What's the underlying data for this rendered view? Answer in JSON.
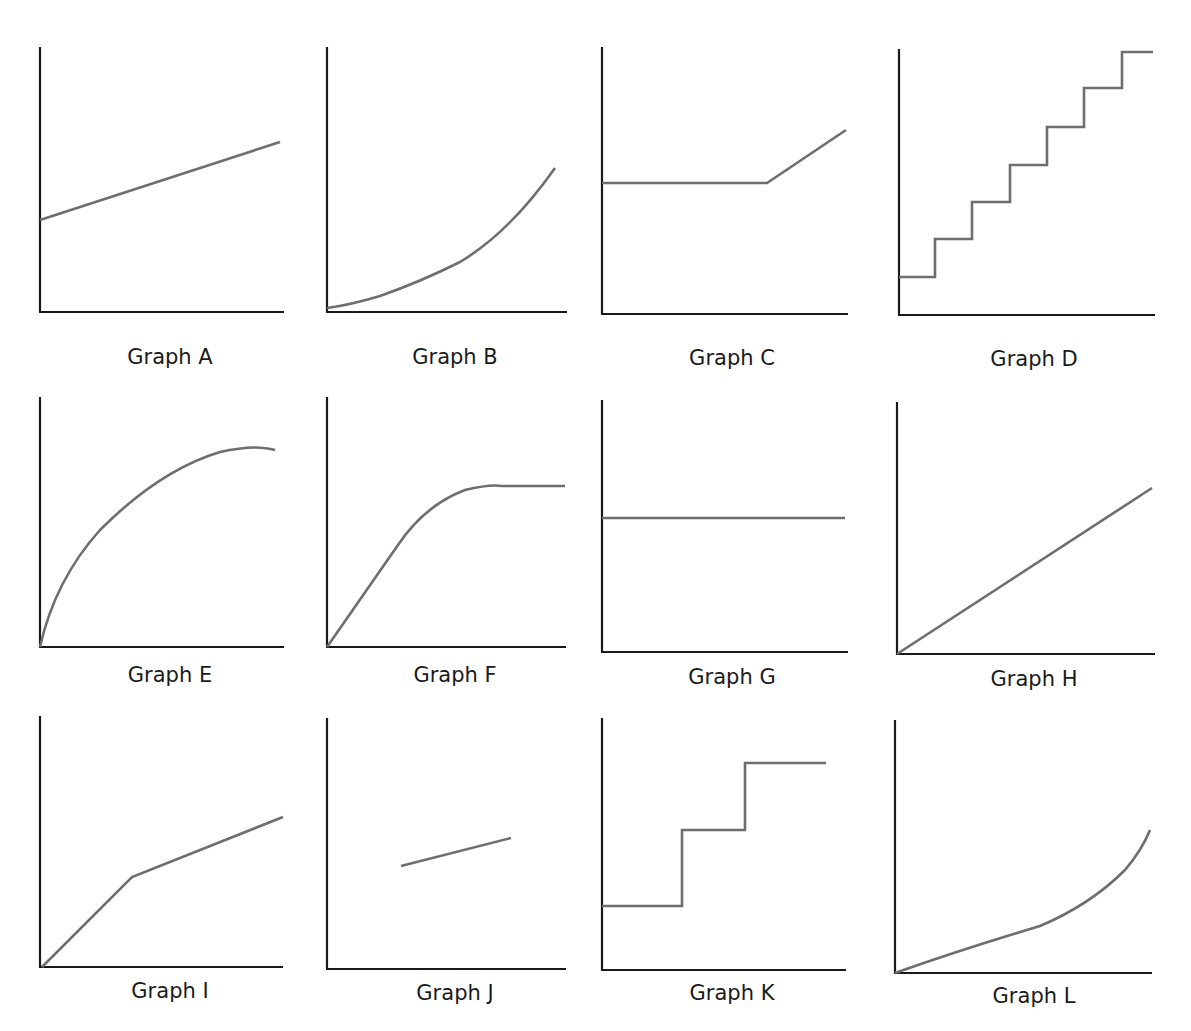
{
  "colors": {
    "axis": "#1a1a1a",
    "curve": "#6e6e6e",
    "background": "#ffffff"
  },
  "graphs": [
    {
      "id": "A",
      "label": "Graph A",
      "x0": 40,
      "y0": 312,
      "xEnd": 284,
      "yTop": 47,
      "capX": 170,
      "capY": 345,
      "path": "M40,220 L280,142",
      "shape": "linear increasing, positive y-intercept"
    },
    {
      "id": "B",
      "label": "Graph B",
      "x0": 327,
      "y0": 312,
      "xEnd": 567,
      "yTop": 47,
      "capX": 455,
      "capY": 345,
      "path": "M327,308 Q350,305 380,296 Q420,282 460,262 Q510,232 555,168",
      "shape": "curve increasing, accelerating"
    },
    {
      "id": "C",
      "label": "Graph C",
      "x0": 602,
      "y0": 314,
      "xEnd": 848,
      "yTop": 47,
      "capX": 732,
      "capY": 346,
      "path": "M602,183 L767,183 L846,130",
      "shape": "constant then linear increase"
    },
    {
      "id": "D",
      "label": "Graph D",
      "x0": 899,
      "y0": 315,
      "xEnd": 1155,
      "yTop": 49,
      "capX": 1034,
      "capY": 347,
      "path": "M899,277 L935,277 L935,239 L972,239 L972,202 L1010,202 L1010,165 L1047,165 L1047,127 L1084,127 L1084,88 L1122,88 L1122,52 L1153,52",
      "shape": "step function, increasing in equal steps"
    },
    {
      "id": "E",
      "label": "Graph E",
      "x0": 40,
      "y0": 647,
      "xEnd": 284,
      "yTop": 397,
      "capX": 170,
      "capY": 663,
      "path": "M40,647 Q55,580 100,530 Q160,470 220,452 Q255,444 275,450",
      "shape": "curve increasing, decelerating to plateau"
    },
    {
      "id": "F",
      "label": "Graph F",
      "x0": 327,
      "y0": 647,
      "xEnd": 566,
      "yTop": 397,
      "capX": 455,
      "capY": 663,
      "path": "M327,647 L398,545 Q425,505 465,490 Q490,484 502,486 L565,486",
      "shape": "linear increase, curve, then constant"
    },
    {
      "id": "G",
      "label": "Graph G",
      "x0": 602,
      "y0": 652,
      "xEnd": 848,
      "yTop": 400,
      "capX": 732,
      "capY": 665,
      "path": "M602,518 L845,518",
      "shape": "constant horizontal line"
    },
    {
      "id": "H",
      "label": "Graph H",
      "x0": 897,
      "y0": 654,
      "xEnd": 1155,
      "yTop": 402,
      "capX": 1034,
      "capY": 667,
      "path": "M897,654 L1152,488",
      "shape": "linear increasing through origin"
    },
    {
      "id": "I",
      "label": "Graph I",
      "x0": 40,
      "y0": 967,
      "xEnd": 283,
      "yTop": 716,
      "capX": 170,
      "capY": 979,
      "path": "M42,967 L132,877 L283,817",
      "shape": "steep linear then shallower linear, through origin"
    },
    {
      "id": "J",
      "label": "Graph J",
      "x0": 327,
      "y0": 969,
      "xEnd": 566,
      "yTop": 718,
      "capX": 455,
      "capY": 981,
      "path": "M401,866 L511,838",
      "shape": "short line segment, slight increase, not touching axes"
    },
    {
      "id": "K",
      "label": "Graph K",
      "x0": 602,
      "y0": 970,
      "xEnd": 846,
      "yTop": 718,
      "capX": 732,
      "capY": 981,
      "path": "M602,906 L682,906 L682,830 L745,830 L745,763 L826,763",
      "shape": "step function, two steps up"
    },
    {
      "id": "L",
      "label": "Graph L",
      "x0": 895,
      "y0": 973,
      "xEnd": 1152,
      "yTop": 720,
      "capX": 1034,
      "capY": 984,
      "path": "M895,973 Q960,950 1040,926 Q1090,905 1125,870 Q1142,850 1150,830",
      "shape": "linear-ish through origin then curving upward"
    }
  ]
}
